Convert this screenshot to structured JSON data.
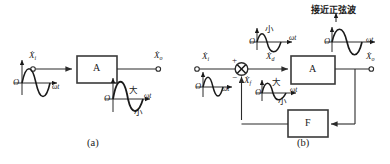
{
  "figure": {
    "title": "",
    "panels": [
      {
        "id": "a",
        "caption": "(a)",
        "blocks": [
          {
            "name": "amplifier",
            "label": "A"
          }
        ],
        "signals": [
          {
            "name": "input",
            "base": "X",
            "sub": "i",
            "dotted": true
          },
          {
            "name": "output",
            "base": "X",
            "sub": "o",
            "dotted": true
          }
        ],
        "waveforms": [
          {
            "name": "input-waveform",
            "origin_label": "O",
            "axis_label": "ωt",
            "shape": "sine",
            "annotations": []
          },
          {
            "name": "output-waveform",
            "origin_label": "O",
            "axis_label": "ωt",
            "shape": "distorted-sine",
            "annotations": [
              {
                "name": "big-half-label",
                "text": "大"
              },
              {
                "name": "small-half-label",
                "text": "小"
              }
            ]
          }
        ]
      },
      {
        "id": "b",
        "caption": "(b)",
        "blocks": [
          {
            "name": "amplifier",
            "label": "A"
          },
          {
            "name": "feedback-network",
            "label": "F"
          }
        ],
        "summing_junction": {
          "name": "summing-junction",
          "plus_sign": "+",
          "minus_sign": "−"
        },
        "signals": [
          {
            "name": "input",
            "base": "X",
            "sub": "i",
            "dotted": true
          },
          {
            "name": "net-input",
            "base": "X",
            "sub": "d",
            "dotted": true
          },
          {
            "name": "feedback",
            "base": "X",
            "sub": "f",
            "dotted": true
          },
          {
            "name": "output",
            "base": "X",
            "sub": "o",
            "dotted": true
          }
        ],
        "waveforms": [
          {
            "name": "input-waveform",
            "origin_label": "O",
            "axis_label": "ωt",
            "shape": "sine",
            "annotations": []
          },
          {
            "name": "net-input-waveform",
            "origin_label": "O",
            "axis_label": "ωt",
            "shape": "predistorted",
            "annotations": [
              {
                "name": "small-half-label",
                "text": "小"
              }
            ]
          },
          {
            "name": "feedback-waveform",
            "origin_label": "O",
            "axis_label": "ωt",
            "shape": "distorted-sine",
            "annotations": [
              {
                "name": "big-half-label",
                "text": "大"
              },
              {
                "name": "small-half-label",
                "text": "小"
              }
            ]
          },
          {
            "name": "output-waveform",
            "origin_label": "O",
            "axis_label": "ωt",
            "shape": "sine",
            "note": "接近正弦波",
            "annotations": []
          }
        ]
      }
    ]
  },
  "colors": {
    "stroke": "#2b2b2b",
    "box_stroke": "#3a3a3a",
    "wave": "#1a1a1a",
    "background": "#ffffff"
  }
}
